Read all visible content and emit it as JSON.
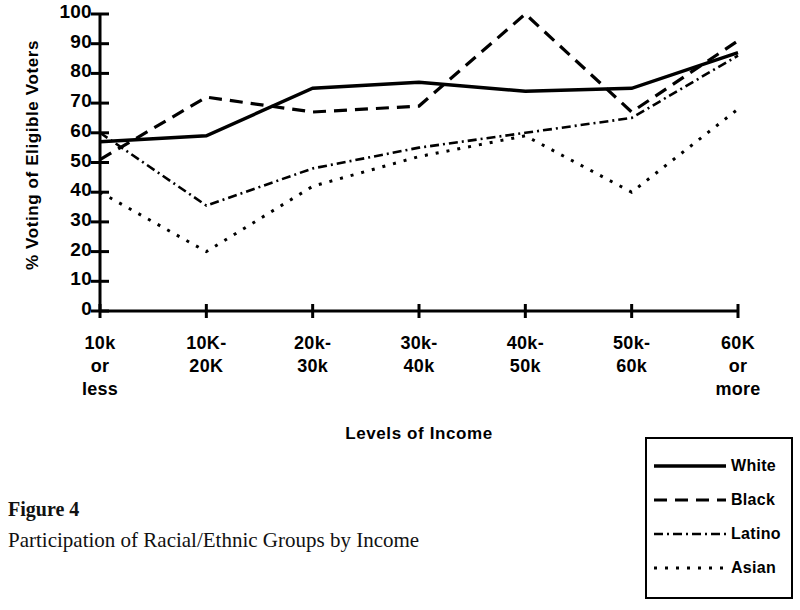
{
  "chart_data": {
    "type": "line",
    "title": "",
    "xlabel": "Levels of Income",
    "ylabel": "% Voting of Eligible Voters",
    "ylim": [
      0,
      100
    ],
    "y_ticks": [
      100,
      90,
      80,
      70,
      60,
      50,
      40,
      30,
      20,
      10,
      0
    ],
    "grid": false,
    "legend_position": "bottom-right",
    "categories": [
      "10k or less",
      "10K-20K",
      "20k-30k",
      "30k-40k",
      "40k-50k",
      "50k-60k",
      "60K or more"
    ],
    "category_lines": [
      [
        "10k",
        "or",
        "less"
      ],
      [
        "10K-",
        "20K"
      ],
      [
        "20k-",
        "30k"
      ],
      [
        "30k-",
        "40k"
      ],
      [
        "40k-",
        "50k"
      ],
      [
        "50k-",
        "60k"
      ],
      [
        "60K",
        "or",
        "more"
      ]
    ],
    "series": [
      {
        "name": "White",
        "style": "solid",
        "values": [
          57,
          59,
          75,
          77,
          74,
          75,
          87
        ]
      },
      {
        "name": "Black",
        "style": "dashed",
        "values": [
          51,
          72,
          67,
          69,
          100,
          67,
          91
        ]
      },
      {
        "name": "Latino",
        "style": "dash-dot-fine",
        "values": [
          60,
          35.5,
          48,
          55,
          60,
          65,
          86
        ]
      },
      {
        "name": "Asian",
        "style": "dotted",
        "values": [
          40,
          20,
          42,
          52,
          59,
          40,
          68
        ]
      }
    ]
  },
  "caption": {
    "figure_label": "Figure 4",
    "description": "Participation of Racial/Ethnic Groups by Income"
  }
}
